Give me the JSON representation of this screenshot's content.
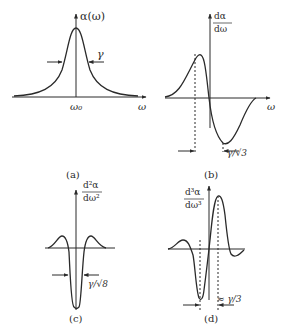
{
  "panels": [
    {
      "id": "a",
      "caption": "(a)",
      "ylabel": "α(ω)",
      "xlabel": "ω",
      "center_tick": "ω₀",
      "width_label": "γ"
    },
    {
      "id": "b",
      "caption": "(b)",
      "ylabel_num": "dα",
      "ylabel_den": "dω",
      "xlabel": "ω",
      "width_label": "γ/√3"
    },
    {
      "id": "c",
      "caption": "(c)",
      "ylabel_num": "d²α",
      "ylabel_den": "dω²",
      "width_label": "γ/√8"
    },
    {
      "id": "d",
      "caption": "(d)",
      "ylabel_num": "d³α",
      "ylabel_den": "dω³",
      "width_label": "≈ γ/3"
    }
  ]
}
